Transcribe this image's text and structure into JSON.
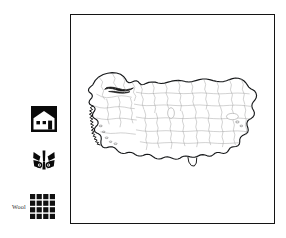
{
  "figure": {
    "kind": "map-figure",
    "background_color": "#ffffff"
  },
  "map": {
    "title": "",
    "region_name": "Turkey",
    "frame_color": "#141414",
    "outline_color": "#16181a",
    "province_border_color": "#9a9a9a",
    "fill_color": "#ffffff"
  },
  "legend": {
    "items": [
      {
        "icon": "house-icon",
        "label": ""
      },
      {
        "icon": "butterfly-motif-icon",
        "label": ""
      },
      {
        "icon": "wool-weave-grid-icon",
        "label": "Wool"
      }
    ]
  }
}
